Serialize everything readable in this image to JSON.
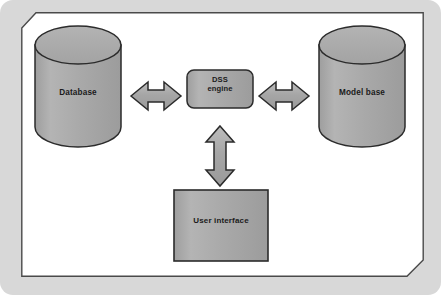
{
  "diagram": {
    "background_color": "#d8d8d8",
    "plate_color": "#ffffff",
    "shape_fill": "#a8a8a8",
    "shape_stroke": "#2b2b2b",
    "label_color": "#1b1b1b",
    "nodes": [
      {
        "id": "database",
        "shape": "cylinder",
        "label": "Database",
        "icon": "database-cylinder-icon"
      },
      {
        "id": "dss-engine",
        "shape": "rounded-rectangle",
        "label": "DSS\nengine",
        "label_line_1": "DSS",
        "label_line_2": "engine",
        "icon": "process-node-icon"
      },
      {
        "id": "model-base",
        "shape": "cylinder",
        "label": "Model base",
        "icon": "database-cylinder-icon"
      },
      {
        "id": "user-interface",
        "shape": "rectangle",
        "label": "User interface",
        "icon": "interface-box-icon"
      }
    ],
    "connectors": [
      {
        "id": "database-to-dss",
        "from": "database",
        "to": "dss-engine",
        "orientation": "horizontal",
        "arrow": "double-headed",
        "icon": "double-arrow-horizontal-icon"
      },
      {
        "id": "dss-to-model-base",
        "from": "dss-engine",
        "to": "model-base",
        "orientation": "horizontal",
        "arrow": "double-headed",
        "icon": "double-arrow-horizontal-icon"
      },
      {
        "id": "dss-to-user-interface",
        "from": "dss-engine",
        "to": "user-interface",
        "orientation": "vertical",
        "arrow": "double-headed",
        "icon": "double-arrow-vertical-icon"
      }
    ]
  }
}
